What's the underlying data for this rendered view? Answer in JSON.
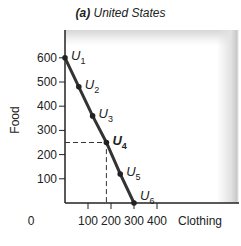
{
  "chart_data": {
    "type": "line",
    "title": "(a) United States",
    "title_prefix": "(a)",
    "title_text": "United States",
    "xlabel": "Clothing",
    "ylabel": "Food",
    "x_origin_label": "0",
    "xticks": [
      100,
      200,
      300,
      400
    ],
    "yticks": [
      100,
      200,
      300,
      400,
      500,
      600
    ],
    "xlim": [
      0,
      400
    ],
    "ylim": [
      0,
      650
    ],
    "grid": false,
    "series": [
      {
        "name": "Budget line",
        "points": [
          {
            "label": "U1",
            "x": 0,
            "y": 600
          },
          {
            "label": "U2",
            "x": 60,
            "y": 480
          },
          {
            "label": "U3",
            "x": 120,
            "y": 360
          },
          {
            "label": "U4",
            "x": 180,
            "y": 250
          },
          {
            "label": "U5",
            "x": 240,
            "y": 120
          },
          {
            "label": "U6",
            "x": 300,
            "y": 0
          }
        ]
      }
    ],
    "annotations": [
      {
        "type": "dashed-guide",
        "point": "U4",
        "x": 180,
        "y": 250,
        "highlighted": true
      }
    ],
    "colors": {
      "line": "#333333",
      "axis": "#222222",
      "panel_shade": "#c8c8c8"
    }
  }
}
